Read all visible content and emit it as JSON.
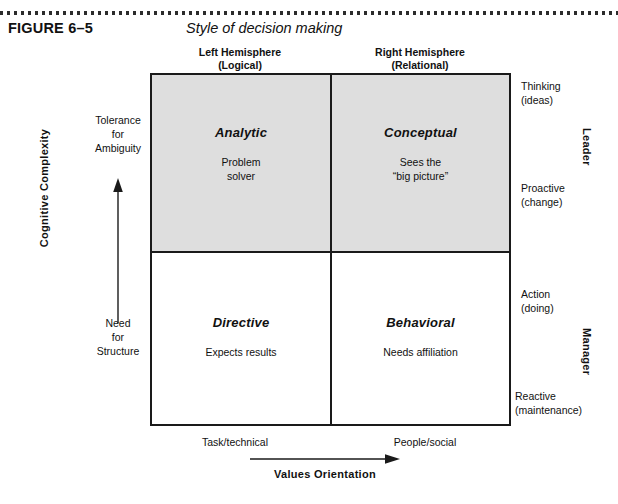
{
  "figure": {
    "label": "FIGURE 6–5",
    "title": "Style of decision making"
  },
  "columns": [
    {
      "name": "Left Hemisphere",
      "qualifier": "(Logical)"
    },
    {
      "name": "Right Hemisphere",
      "qualifier": "(Relational)"
    }
  ],
  "quadrants": [
    {
      "position": "top-left",
      "title": "Analytic",
      "description": "Problem\nsolver",
      "fill": "#dedede"
    },
    {
      "position": "top-right",
      "title": "Conceptual",
      "description": "Sees the\n“big picture”",
      "fill": "#dedede"
    },
    {
      "position": "bottom-left",
      "title": "Directive",
      "description": "Expects results",
      "fill": "#ffffff"
    },
    {
      "position": "bottom-right",
      "title": "Behavioral",
      "description": "Needs affiliation",
      "fill": "#ffffff"
    }
  ],
  "y_axis": {
    "title": "Cognitive Complexity",
    "high_label": "Tolerance\nfor\nAmbiguity",
    "low_label": "Need\nfor\nStructure",
    "arrow_direction": "up"
  },
  "x_axis": {
    "title": "Values Orientation",
    "left_label": "Task/technical",
    "right_label": "People/social",
    "arrow_direction": "right"
  },
  "right_labels": {
    "thinking": "Thinking\n(ideas)",
    "proactive": "Proactive\n(change)",
    "action": "Action\n(doing)",
    "reactive": "Reactive\n(maintenance)"
  },
  "right_groups": {
    "leader": "Leader",
    "manager": "Manager"
  },
  "chart_data": {
    "type": "table",
    "title": "Style of decision making",
    "xlabel": "Values Orientation",
    "ylabel": "Cognitive Complexity",
    "x_categories": [
      "Left Hemisphere (Logical)",
      "Right Hemisphere (Relational)"
    ],
    "y_categories": [
      "High cognitive complexity (Tolerance for Ambiguity)",
      "Low cognitive complexity (Need for Structure)"
    ],
    "cells": [
      {
        "row": 0,
        "col": 0,
        "title": "Analytic",
        "description": "Problem solver",
        "shaded": true
      },
      {
        "row": 0,
        "col": 1,
        "title": "Conceptual",
        "description": "Sees the “big picture”",
        "shaded": true
      },
      {
        "row": 1,
        "col": 0,
        "title": "Directive",
        "description": "Expects results",
        "shaded": false
      },
      {
        "row": 1,
        "col": 1,
        "title": "Behavioral",
        "description": "Needs affiliation",
        "shaded": false
      }
    ],
    "x_axis_range_labels": [
      "Task/technical",
      "People/social"
    ],
    "y_axis_range_labels": [
      "Need for Structure",
      "Tolerance for Ambiguity"
    ],
    "right_scale": [
      "Thinking (ideas)",
      "Proactive (change)",
      "Action (doing)",
      "Reactive (maintenance)"
    ],
    "right_groups": [
      "Leader",
      "Manager"
    ],
    "grid": true,
    "legend": "none"
  },
  "colors": {
    "shaded_fill": "#dedede",
    "plain_fill": "#ffffff",
    "border": "#1a1a1a",
    "text": "#111111"
  }
}
